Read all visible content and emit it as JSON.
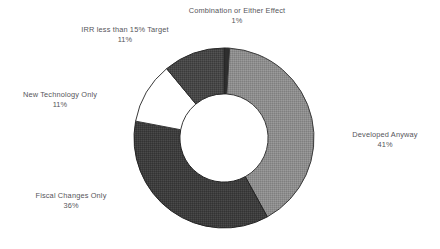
{
  "chart_data": {
    "type": "pie",
    "variant": "donut",
    "title": "",
    "xlabel": "",
    "ylabel": "",
    "units": "percent",
    "hole_ratio": 0.49,
    "start_angle_deg": 0,
    "direction": "clockwise",
    "legend_position": "none",
    "labels_position": "outside",
    "grid": false,
    "categories": [
      "Combination or Either Effect",
      "Developed Anyway",
      "Fiscal Changes Only",
      "New Technology Only",
      "IRR less than 15% Target"
    ],
    "values": [
      1,
      41,
      36,
      11,
      11
    ],
    "slices": [
      {
        "name": "Combination or Either Effect",
        "value": 1,
        "value_label": "1%",
        "color": "#2e2e2e",
        "stroke": "#1d1d1d"
      },
      {
        "name": "Developed Anyway",
        "value": 41,
        "value_label": "41%",
        "color": "#8d8d8d",
        "stroke": "#3a3a3a"
      },
      {
        "name": "Fiscal Changes Only",
        "value": 36,
        "value_label": "36%",
        "color": "#3d3d3d",
        "stroke": "#242424"
      },
      {
        "name": "New Technology Only",
        "value": 11,
        "value_label": "11%",
        "color": "#ffffff",
        "stroke": "#3a3a3a"
      },
      {
        "name": "IRR less than 15% Target",
        "value": 11,
        "value_label": "11%",
        "color": "#484848",
        "stroke": "#2a2a2a"
      }
    ]
  },
  "labels": {
    "combination": {
      "name": "Combination or Either Effect",
      "value": "1%"
    },
    "developed": {
      "name": "Developed Anyway",
      "value": "41%"
    },
    "fiscal": {
      "name": "Fiscal Changes Only",
      "value": "36%"
    },
    "newtech": {
      "name": "New Technology Only",
      "value": "11%"
    },
    "irr": {
      "name": "IRR less than 15% Target",
      "value": "11%"
    }
  }
}
